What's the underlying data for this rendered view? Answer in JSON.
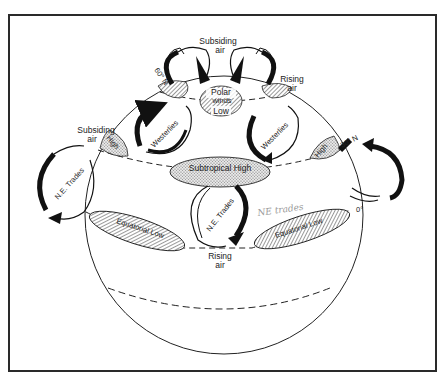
{
  "diagram": {
    "type": "global-atmospheric-circulation",
    "labels": {
      "top_subsiding": [
        "Subsiding",
        "air"
      ],
      "polar_low": [
        "Polar",
        "winds",
        "Low"
      ],
      "rising_top_right": [
        "Rising",
        "air"
      ],
      "lat_60": "60° N",
      "lat_30": "30° N",
      "lat_0": "0°",
      "left_subsiding": [
        "Subsiding",
        "air"
      ],
      "high_left": "High",
      "high_right": "High",
      "westerlies_left": "Westerlies",
      "westerlies_right": "Westerlies",
      "subtropical_high": "Subtropical High",
      "ne_trades_left": "N.E. Trades",
      "ne_trades_center": "N.E. Trades",
      "equatorial_low_left": "Equatorial Low",
      "equatorial_low_right": "Equatorial Low",
      "rising_bottom": [
        "Rising",
        "air"
      ],
      "handwritten_note": "NE trades"
    },
    "colors": {
      "ink": "#1a1a1a",
      "frame": "#2a2a2a",
      "stipple": "#cfcfcf",
      "hatch": "#8a8a8a",
      "handwriting": "#9a9a9a"
    }
  }
}
